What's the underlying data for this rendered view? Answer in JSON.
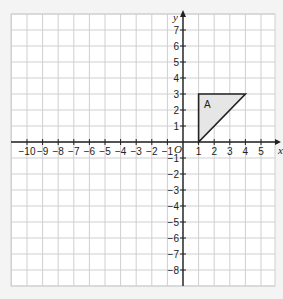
{
  "chart_data": {
    "type": "coordinate-grid",
    "title": "",
    "xlabel": "x",
    "ylabel": "y",
    "origin_label": "O",
    "xlim": [
      -11,
      6
    ],
    "ylim": [
      -9,
      8
    ],
    "grid": true,
    "x_ticks": [
      -10,
      -9,
      -8,
      -7,
      -6,
      -5,
      -4,
      -3,
      -2,
      -1,
      1,
      2,
      3,
      4,
      5
    ],
    "y_ticks": [
      7,
      6,
      5,
      4,
      3,
      2,
      1,
      -1,
      -2,
      -3,
      -4,
      -5,
      -6,
      -7,
      -8
    ],
    "shapes": [
      {
        "label": "A",
        "type": "triangle",
        "vertices": [
          [
            1,
            0
          ],
          [
            1,
            3
          ],
          [
            4,
            3
          ]
        ],
        "fill": "#e6e6e6",
        "stroke": "#222222"
      }
    ]
  },
  "colors": {
    "background": "#f4f4f4",
    "plot_bg": "#ffffff",
    "grid": "#cfcfcf",
    "axis": "#222222",
    "shape_fill": "#e6e6e6"
  }
}
